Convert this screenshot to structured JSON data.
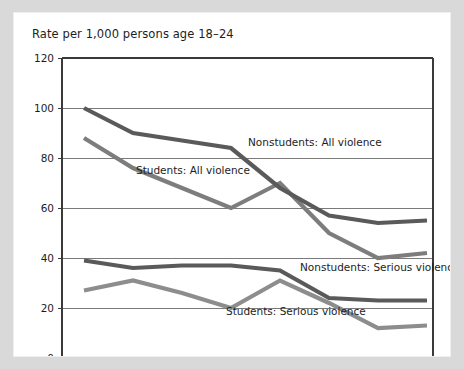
{
  "chart_data": {
    "type": "line",
    "title": "Rate per 1,000 persons age 18–24",
    "xlabel": "",
    "ylabel": "",
    "ylim": [
      0,
      120
    ],
    "yticks": [
      0,
      20,
      40,
      60,
      80,
      100,
      120
    ],
    "grid": true,
    "legend_position": "inline-annotations",
    "categories": [
      "1995",
      "1996",
      "1997",
      "1998",
      "1999",
      "2000",
      "2001",
      "2002"
    ],
    "series": [
      {
        "name": "Nonstudents: All violence",
        "color": "#5a5a5a",
        "values": [
          100,
          90,
          87,
          84,
          68,
          57,
          54,
          55
        ]
      },
      {
        "name": "Students: All violence",
        "color": "#7d7d7d",
        "values": [
          88,
          76,
          68,
          60,
          70,
          50,
          40,
          42
        ]
      },
      {
        "name": "Nonstudents: Serious violence",
        "color": "#5a5a5a",
        "values": [
          39,
          36,
          37,
          37,
          35,
          24,
          23,
          23
        ]
      },
      {
        "name": "Students: Serious violence",
        "color": "#8d8d8d",
        "values": [
          27,
          31,
          26,
          20,
          31,
          22,
          12,
          13
        ]
      }
    ],
    "annotations": [
      {
        "text": "Nonstudents: All violence",
        "series": "Nonstudents: All violence",
        "x_px": 234,
        "y_px": 133,
        "align": "start"
      },
      {
        "text": "Students: All violence",
        "series": "Students: All violence",
        "x_px": 122,
        "y_px": 161,
        "align": "start"
      },
      {
        "text": "Nonstudents: Serious violence",
        "series": "Nonstudents: Serious violence",
        "x_px": 286,
        "y_px": 258,
        "align": "start"
      },
      {
        "text": "Students: Serious violence",
        "series": "Students: Serious violence",
        "x_px": 212,
        "y_px": 302,
        "align": "start"
      }
    ]
  },
  "ticks": {
    "y": [
      "120",
      "100",
      "80",
      "60",
      "40",
      "20",
      "0"
    ],
    "x": [
      "1995",
      "1996",
      "1997",
      "1998",
      "1999",
      "2000",
      "2001",
      "2002"
    ]
  },
  "labels": {
    "nonstudents_all": "Nonstudents: All violence",
    "students_all": "Students: All violence",
    "nonstudents_serious": "Nonstudents: Serious violence",
    "students_serious": "Students: Serious violence"
  },
  "colors": {
    "dark_line": "#5a5a5a",
    "mid_line": "#7d7d7d",
    "light_line": "#8d8d8d",
    "grid": "#7a7a7a",
    "axis": "#3a3a3a",
    "panel": "#ffffff",
    "page": "#d9d9d9"
  }
}
